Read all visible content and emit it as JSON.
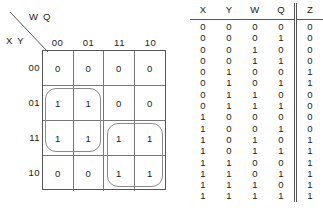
{
  "kmap": {
    "col_variables": "W Q",
    "row_variables": "X Y",
    "col_headers": [
      "00",
      "01",
      "11",
      "10"
    ],
    "row_headers": [
      "00",
      "01",
      "11",
      "10"
    ],
    "cells": [
      [
        "0",
        "0",
        "0",
        "0"
      ],
      [
        "1",
        "1",
        "0",
        "0"
      ],
      [
        "1",
        "1",
        "1",
        "1"
      ],
      [
        "0",
        "0",
        "1",
        "1"
      ]
    ],
    "groups": [
      {
        "name": "group-left",
        "row_start": 1,
        "row_span": 2,
        "col_start": 0,
        "col_span": 2
      },
      {
        "name": "group-right",
        "row_start": 2,
        "row_span": 2,
        "col_start": 2,
        "col_span": 2
      }
    ],
    "line_color": "#777777",
    "group_color": "#8a8a8a"
  },
  "truth_table": {
    "headers": [
      "X",
      "Y",
      "W",
      "Q",
      "Z"
    ],
    "rows": [
      {
        "X": "0",
        "Y": "0",
        "W": "0",
        "Q": "0",
        "Z": "0"
      },
      {
        "X": "0",
        "Y": "0",
        "W": "0",
        "Q": "1",
        "Z": "0"
      },
      {
        "X": "0",
        "Y": "0",
        "W": "1",
        "Q": "0",
        "Z": "0"
      },
      {
        "X": "0",
        "Y": "0",
        "W": "1",
        "Q": "1",
        "Z": "0"
      },
      {
        "X": "0",
        "Y": "1",
        "W": "0",
        "Q": "0",
        "Z": "1"
      },
      {
        "X": "0",
        "Y": "1",
        "W": "0",
        "Q": "1",
        "Z": "1"
      },
      {
        "X": "0",
        "Y": "1",
        "W": "1",
        "Q": "0",
        "Z": "0"
      },
      {
        "X": "0",
        "Y": "1",
        "W": "1",
        "Q": "1",
        "Z": "0"
      },
      {
        "X": "1",
        "Y": "0",
        "W": "0",
        "Q": "0",
        "Z": "0"
      },
      {
        "X": "1",
        "Y": "0",
        "W": "0",
        "Q": "1",
        "Z": "0"
      },
      {
        "X": "1",
        "Y": "0",
        "W": "1",
        "Q": "0",
        "Z": "1"
      },
      {
        "X": "1",
        "Y": "0",
        "W": "1",
        "Q": "1",
        "Z": "1"
      },
      {
        "X": "1",
        "Y": "1",
        "W": "0",
        "Q": "0",
        "Z": "1"
      },
      {
        "X": "1",
        "Y": "1",
        "W": "0",
        "Q": "1",
        "Z": "1"
      },
      {
        "X": "1",
        "Y": "1",
        "W": "1",
        "Q": "0",
        "Z": "1"
      },
      {
        "X": "1",
        "Y": "1",
        "W": "1",
        "Q": "1",
        "Z": "1"
      }
    ]
  }
}
